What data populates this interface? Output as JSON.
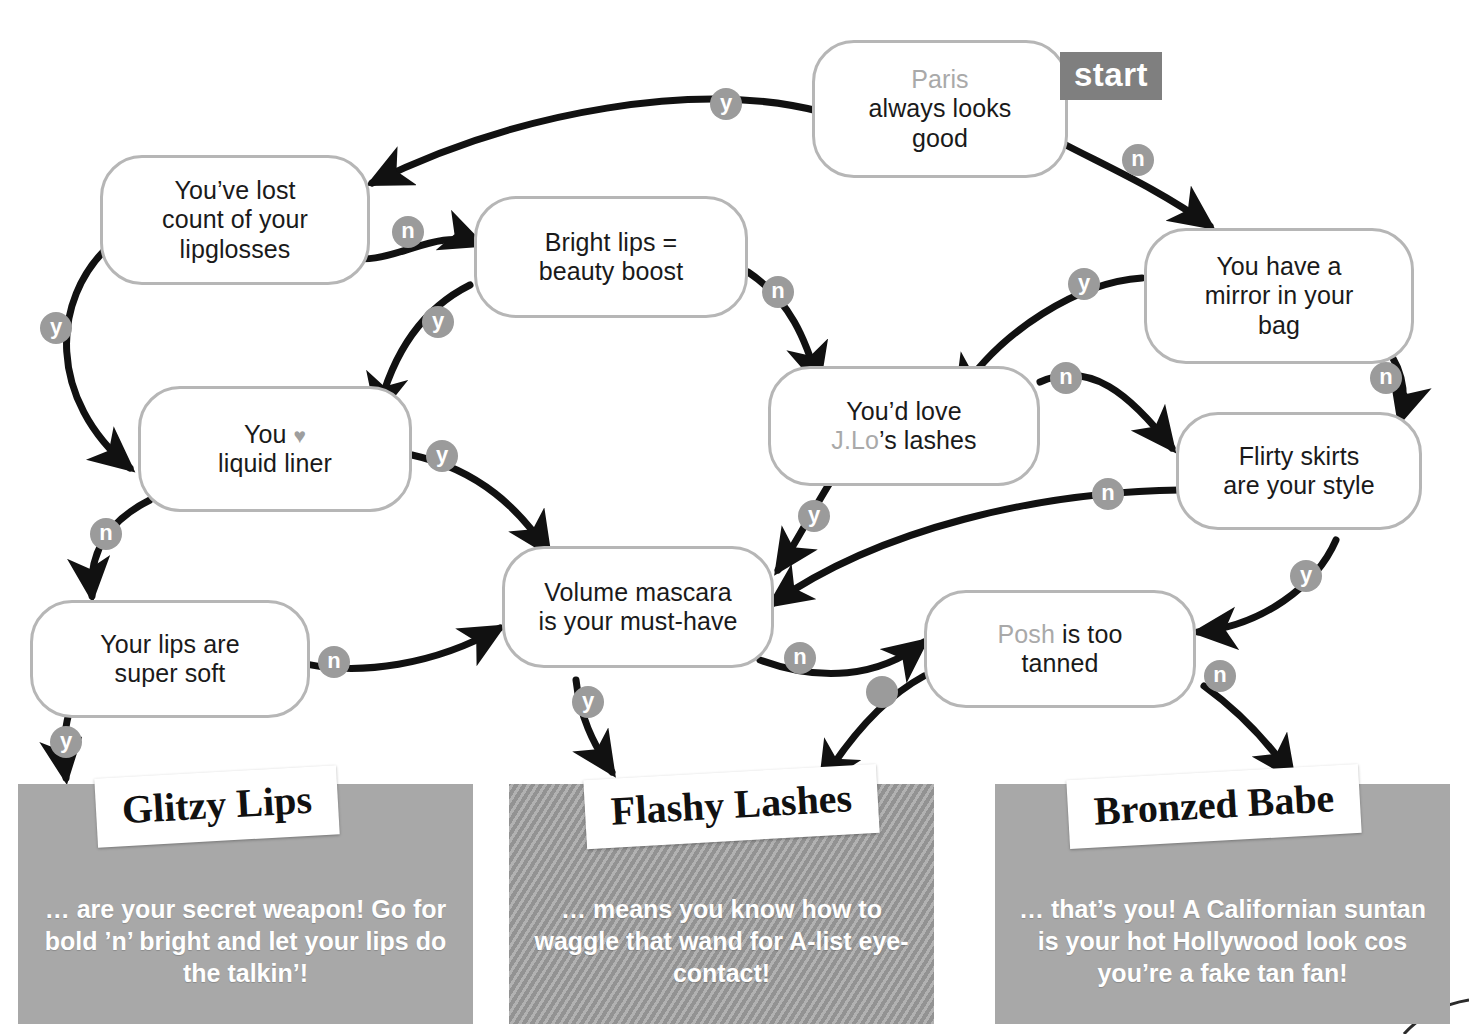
{
  "start": {
    "badge_label": "start"
  },
  "nodes": [
    {
      "id": "paris",
      "dim_text": "Paris",
      "text": "always looks good"
    },
    {
      "id": "lipgloss",
      "text": "You’ve lost count of your lipglosses"
    },
    {
      "id": "bright",
      "text": "Bright lips = beauty boost"
    },
    {
      "id": "mirror",
      "text": "You have a mirror in your bag"
    },
    {
      "id": "liner",
      "text": "You ♥ liquid liner"
    },
    {
      "id": "jlo",
      "text": "You’d love J.Lo’s lashes",
      "dim_text": "J.Lo"
    },
    {
      "id": "skirts",
      "text": "Flirty skirts are your style"
    },
    {
      "id": "mascara",
      "text": "Volume mascara is your must-have"
    },
    {
      "id": "softlips",
      "text": "Your lips are super soft"
    },
    {
      "id": "posh",
      "dim_text": "Posh",
      "text": "is too tanned"
    }
  ],
  "node_text": {
    "paris_dim": "Paris",
    "paris_l1": "always looks",
    "paris_l2": "good",
    "lipgloss_l1": "You’ve lost",
    "lipgloss_l2": "count of your",
    "lipgloss_l3": "lipglosses",
    "bright_l1": "Bright lips =",
    "bright_l2": "beauty boost",
    "mirror_l1": "You have a",
    "mirror_l2": "mirror in your",
    "mirror_l3": "bag",
    "liner_l1": "You",
    "liner_heart": "♥",
    "liner_l2": "liquid liner",
    "jlo_l1": "You’d love",
    "jlo_dim": "J.Lo",
    "jlo_l2": "’s lashes",
    "skirts_l1": "Flirty skirts",
    "skirts_l2": "are your style",
    "mascara_l1": "Volume mascara",
    "mascara_l2": "is your must-have",
    "softlips_l1": "Your lips are",
    "softlips_l2": "super soft",
    "posh_dim": "Posh",
    "posh_l1": "is too",
    "posh_l2": "tanned"
  },
  "edge_labels": {
    "paris_yes": "y",
    "paris_no": "n",
    "lipgloss_yes": "y",
    "lipgloss_no": "n",
    "bright_yes": "y",
    "bright_no": "n",
    "mirror_yes": "y",
    "mirror_no": "n",
    "liner_yes": "y",
    "liner_no": "n",
    "jlo_yes": "y",
    "jlo_no": "n",
    "skirts_yes": "y",
    "skirts_no": "n",
    "mascara_yes": "y",
    "mascara_no": "n",
    "softlips_yes": "y",
    "softlips_no": "n",
    "posh_no": "n"
  },
  "results": [
    {
      "id": "glitzy",
      "label": "Glitzy Lips",
      "body": "… are your secret weapon! Go for bold ’n’ bright and let your lips do the talkin’!"
    },
    {
      "id": "flashy",
      "label": "Flashy Lashes",
      "body": "… means you know how to waggle that wand for A-list eye-contact!"
    },
    {
      "id": "bronzed",
      "label": "Bronzed Babe",
      "body": "… that’s you! A Californian suntan is your hot Hollywood look cos you’re a fake tan fan!"
    }
  ],
  "colors": {
    "node_border": "#b6b6b6",
    "chip_bg": "#9b9b9b",
    "start_bg": "#7f7f7f",
    "edge": "#111111",
    "panel_gray": "#a8a8a8",
    "dim_text": "#a9a9a9"
  }
}
